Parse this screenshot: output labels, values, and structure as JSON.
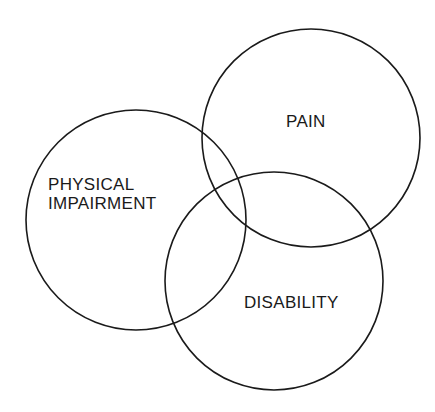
{
  "diagram": {
    "type": "venn",
    "sets": [
      {
        "id": "pain",
        "label": "PAIN",
        "cx": 311,
        "cy": 138,
        "r": 109
      },
      {
        "id": "physical-impairment",
        "label_lines": [
          "PHYSICAL",
          "IMPAIRMENT"
        ],
        "cx": 136,
        "cy": 220,
        "r": 110
      },
      {
        "id": "disability",
        "label": "DISABILITY",
        "cx": 274,
        "cy": 281,
        "r": 109
      }
    ],
    "colors": {
      "stroke": "#1a1a1a",
      "background": "#ffffff"
    }
  }
}
